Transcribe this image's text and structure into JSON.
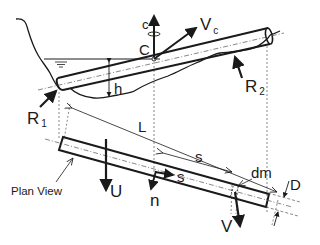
{
  "figure": {
    "colors": {
      "ink": "#1a1a1a",
      "background": "#ffffff"
    }
  },
  "labels": {
    "rotation": "c",
    "center": "C",
    "velocity_center": "V",
    "velocity_center_sub": "c",
    "depth": "h",
    "reaction_1": "R",
    "reaction_1_sub": "1",
    "reaction_2": "R",
    "reaction_2_sub": "2",
    "length": "L",
    "arc_length": "s",
    "tangent_axis": "s",
    "normal_axis": "n",
    "element_mass": "dm",
    "diameter": "D",
    "flow_velocity": "U",
    "element_velocity": "V",
    "plan_view": "Plan View"
  }
}
